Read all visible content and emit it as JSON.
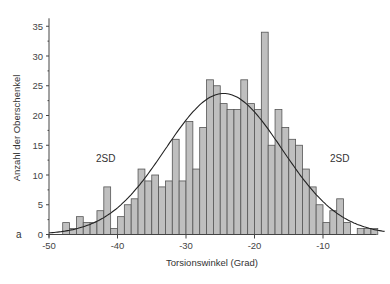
{
  "chart_data": {
    "type": "bar",
    "subtype": "histogram with fitted normal curve",
    "title": "",
    "panel_label": "a",
    "xlabel": "Torsionswinkel (Grad)",
    "ylabel": "Anzahl der Oberschenkel",
    "xlim": [
      -50,
      -1
    ],
    "ylim": [
      0,
      36
    ],
    "xticks": [
      -50,
      -40,
      -30,
      -20,
      -10
    ],
    "yticks": [
      0,
      5,
      10,
      15,
      20,
      25,
      30,
      35
    ],
    "bin_width": 1,
    "bins": [
      -48,
      -47,
      -46,
      -45,
      -44,
      -43,
      -42,
      -41,
      -40,
      -39,
      -38,
      -37,
      -36,
      -35,
      -34,
      -33,
      -32,
      -31,
      -30,
      -29,
      -28,
      -27,
      -26,
      -25,
      -24,
      -23,
      -22,
      -21,
      -20,
      -19,
      -18,
      -17,
      -16,
      -15,
      -14,
      -13,
      -12,
      -11,
      -10,
      -9,
      -8,
      -7,
      -6,
      -5,
      -4,
      -3
    ],
    "values": [
      2,
      1,
      3,
      2,
      2,
      4,
      8,
      1,
      3,
      5,
      6,
      11,
      9,
      10,
      8,
      9,
      16,
      9,
      19,
      11,
      18,
      26,
      25,
      22,
      21,
      21,
      26,
      22,
      21,
      34,
      15,
      21,
      18,
      16,
      15,
      11,
      8,
      5,
      2,
      4,
      6,
      2,
      0,
      1,
      1,
      1
    ],
    "fit_curve": {
      "type": "normal",
      "mean": -24.5,
      "sd": 8.5,
      "peak": 23.7
    },
    "annotations": [
      {
        "text": "2SD",
        "x": -42,
        "y": 12
      },
      {
        "text": "2SD",
        "x": -8,
        "y": 12
      }
    ],
    "grid": false,
    "legend": null
  },
  "labels": {
    "xlabel": "Torsionswinkel (Grad)",
    "ylabel": "Anzahl der Oberschenkel",
    "panel": "a",
    "sd_left": "2SD",
    "sd_right": "2SD"
  }
}
